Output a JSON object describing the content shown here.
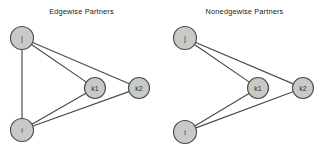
{
  "figure": {
    "width": 326,
    "height": 155,
    "background_color": "#ffffff",
    "node_fill_color": "#c9c9c9",
    "node_stroke_color": "#4d4d4d",
    "edge_color": "#4a4a4a",
    "label_color": "#2b2b2b"
  },
  "chart_data": {
    "type": "diagram",
    "title": "",
    "panels": [
      {
        "id": "edgewise",
        "title": "Edgewise Partners",
        "nodes": [
          {
            "id": "j",
            "label": "j",
            "x": 22,
            "y": 38,
            "r": 11.5
          },
          {
            "id": "i",
            "label": "i",
            "x": 22,
            "y": 130,
            "r": 11.5
          },
          {
            "id": "k1",
            "label": "k1",
            "x": 95,
            "y": 88,
            "r": 10.5
          },
          {
            "id": "k2",
            "label": "k2",
            "x": 139,
            "y": 88,
            "r": 10.5
          }
        ],
        "edges": [
          {
            "source": "j",
            "target": "i"
          },
          {
            "source": "j",
            "target": "k1"
          },
          {
            "source": "j",
            "target": "k2"
          },
          {
            "source": "i",
            "target": "k1"
          },
          {
            "source": "i",
            "target": "k2"
          }
        ]
      },
      {
        "id": "nonedgewise",
        "title": "Nonedgewise Partners",
        "nodes": [
          {
            "id": "j",
            "label": "j",
            "x": 22,
            "y": 38,
            "r": 11.5
          },
          {
            "id": "i",
            "label": "i",
            "x": 22,
            "y": 132,
            "r": 11.5
          },
          {
            "id": "k1",
            "label": "k1",
            "x": 95,
            "y": 88,
            "r": 10.5
          },
          {
            "id": "k2",
            "label": "k2",
            "x": 140,
            "y": 88,
            "r": 10.5
          }
        ],
        "edges": [
          {
            "source": "j",
            "target": "k1"
          },
          {
            "source": "j",
            "target": "k2"
          },
          {
            "source": "i",
            "target": "k1"
          },
          {
            "source": "i",
            "target": "k2"
          }
        ]
      }
    ]
  }
}
